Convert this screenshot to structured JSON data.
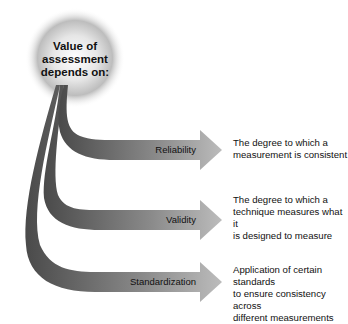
{
  "diagram": {
    "center": {
      "lines": [
        "Value of",
        "assessment",
        "depends on:"
      ]
    },
    "branches": [
      {
        "label": "Reliability",
        "description": [
          "The degree to which a",
          "measurement is consistent"
        ]
      },
      {
        "label": "Validity",
        "description": [
          "The degree to which a",
          "technique measures what it",
          "is designed to measure"
        ]
      },
      {
        "label": "Standardization",
        "description": [
          "Application of certain standards",
          "to ensure consistency across",
          "different measurements"
        ]
      }
    ]
  }
}
